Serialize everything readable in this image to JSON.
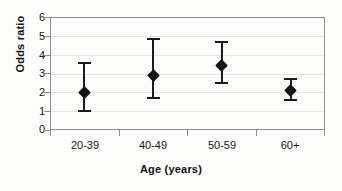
{
  "chart_data": {
    "type": "scatter",
    "title": "",
    "xlabel": "Age (years)",
    "ylabel": "Odds ratio",
    "categories": [
      "20-39",
      "40-49",
      "50-59",
      "60+"
    ],
    "values": [
      2.0,
      2.9,
      3.45,
      2.1
    ],
    "error_low": [
      1.05,
      1.75,
      2.55,
      1.65
    ],
    "error_high": [
      3.6,
      4.9,
      4.7,
      2.75
    ],
    "series": [
      {
        "name": "Odds ratio",
        "points": [
          {
            "category": "20-39",
            "value": 2.0,
            "lower": 1.05,
            "upper": 3.6
          },
          {
            "category": "40-49",
            "value": 2.9,
            "lower": 1.75,
            "upper": 4.9
          },
          {
            "category": "50-59",
            "value": 3.45,
            "lower": 2.55,
            "upper": 4.7
          },
          {
            "category": "60+",
            "value": 2.1,
            "lower": 1.65,
            "upper": 2.75
          }
        ]
      }
    ],
    "ylim": [
      0,
      6
    ],
    "yticks": [
      "0",
      "1",
      "2",
      "3",
      "4",
      "5",
      "6"
    ],
    "grid": true,
    "legend": "none",
    "marker": "diamond",
    "marker_color": "#131313",
    "error_bar_color": "#1b1b1b",
    "axis_color": "#8d8d8d",
    "grid_color": "#e4e4e0"
  }
}
